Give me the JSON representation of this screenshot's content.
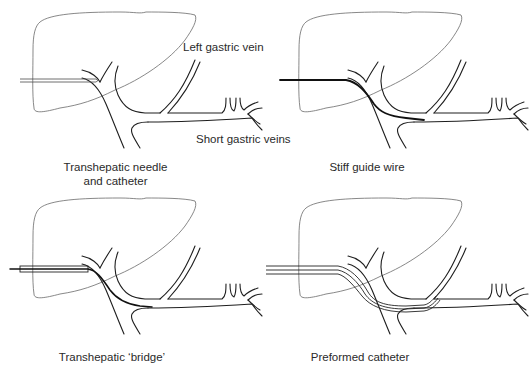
{
  "figure": {
    "annotations": {
      "left_gastric_vein": "Left gastric vein",
      "short_gastric_veins": "Short gastric veins"
    },
    "panels": [
      {
        "id": "top-left",
        "caption_line1": "Transhepatic needle",
        "caption_line2": "and catheter",
        "device": "double-line needle/catheter entering through liver"
      },
      {
        "id": "top-right",
        "caption_line1": "Stiff guide wire",
        "device": "thick wire passed through portal vein into splenic vein"
      },
      {
        "id": "bottom-left",
        "caption_line1": "Transhepatic ‘bridge’",
        "device": "sheath with wire extending into splenic vein"
      },
      {
        "id": "bottom-right",
        "caption_line1": "Preformed catheter",
        "device": "curved catheter directed to left gastric vein"
      }
    ],
    "colors": {
      "line": "#1e1e1e",
      "liver_outline": "#6a6a6a",
      "background": "#ffffff"
    }
  }
}
